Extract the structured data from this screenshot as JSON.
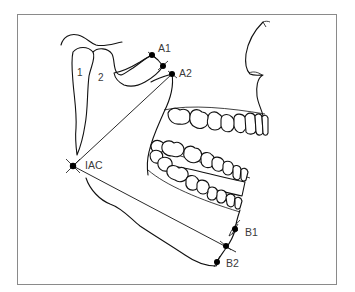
{
  "figure": {
    "frame_color": "#8a8a8a",
    "line_color": "#111111",
    "label_color": "#3a3a3a",
    "regions": [
      {
        "id": "1",
        "label": "1"
      },
      {
        "id": "2",
        "label": "2"
      }
    ],
    "landmarks": [
      {
        "id": "A1",
        "label": "A1"
      },
      {
        "id": "A2",
        "label": "A2"
      },
      {
        "id": "IAC",
        "label": "IAC"
      },
      {
        "id": "B1",
        "label": "B1"
      },
      {
        "id": "B2",
        "label": "B2"
      }
    ],
    "measurement_lines": [
      {
        "from": "IAC",
        "to": "A2"
      },
      {
        "from": "IAC",
        "to": "B1/B2 midpoint"
      }
    ]
  }
}
